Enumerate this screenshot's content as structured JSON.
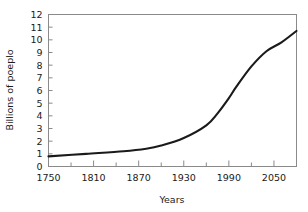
{
  "chart_data": {
    "type": "line",
    "title": "",
    "xlabel": "Years",
    "ylabel": "Billions of poeplo",
    "xlim": [
      1750,
      2080
    ],
    "ylim": [
      0,
      12
    ],
    "grid": false,
    "legend": null,
    "x_ticks_major": [
      1750,
      1810,
      1870,
      1930,
      1990,
      2050
    ],
    "x_ticks_minor": [
      1780,
      1840,
      1900,
      1960,
      2020,
      2080
    ],
    "y_ticks": [
      0,
      1,
      2,
      3,
      4,
      5,
      6,
      7,
      8,
      9,
      10,
      11,
      12
    ],
    "series": [
      {
        "name": "World population",
        "x": [
          1750,
          1800,
          1850,
          1880,
          1900,
          1930,
          1960,
          1975,
          1990,
          2000,
          2020,
          2040,
          2060,
          2080
        ],
        "values": [
          0.8,
          1.0,
          1.2,
          1.4,
          1.65,
          2.25,
          3.25,
          4.2,
          5.4,
          6.3,
          7.9,
          9.1,
          9.8,
          10.7
        ]
      }
    ]
  },
  "axes": {
    "y_label": "Billions of poeplo",
    "x_label": "Years",
    "y_tick_labels": [
      "12",
      "11",
      "10",
      "9",
      "8",
      "7",
      "6",
      "5",
      "4",
      "3",
      "2",
      "1",
      "0"
    ],
    "x_tick_labels": [
      "1750",
      "1810",
      "1870",
      "1930",
      "1990",
      "2050"
    ]
  },
  "colors": {
    "curve": "#1a1a1a",
    "frame": "#8a8a8a",
    "text": "#1a1a1a",
    "background": "#ffffff"
  }
}
